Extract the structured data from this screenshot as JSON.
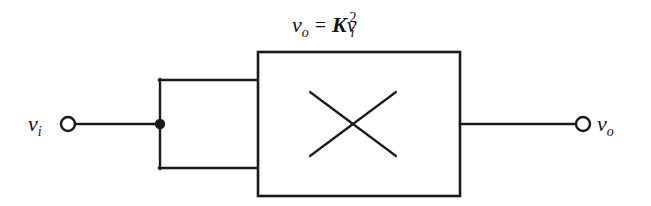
{
  "diagram": {
    "background_color": "#ffffff",
    "stroke_color": "#1a1a1a",
    "equation": {
      "lhs_var": "v",
      "lhs_sub": "o",
      "equals": "=",
      "gain": "K",
      "rhs_var": "v",
      "rhs_sub": "i",
      "rhs_sup": "2",
      "plain_text": "v_o = K v_i^2"
    },
    "input_terminal": {
      "var": "v",
      "sub": "i",
      "plain_text": "v_i"
    },
    "output_terminal": {
      "var": "v",
      "sub": "o",
      "plain_text": "v_o"
    },
    "block": {
      "symbol": "multiplier-x",
      "x": 258,
      "y": 52,
      "width": 202,
      "height": 144
    },
    "junction": {
      "x": 160,
      "y": 124
    },
    "terminals": {
      "input_circle": {
        "cx": 68,
        "cy": 124,
        "r": 7
      },
      "output_circle": {
        "cx": 583,
        "cy": 124,
        "r": 7
      }
    },
    "wires": {
      "input_lead": {
        "x1": 75,
        "y1": 124,
        "x2": 160,
        "y2": 124
      },
      "split_vertical": {
        "x1": 160,
        "y1": 80,
        "x2": 160,
        "y2": 168
      },
      "upper_feedback": {
        "x1": 160,
        "y1": 80,
        "x2": 258,
        "y2": 80
      },
      "lower_feedback": {
        "x1": 160,
        "y1": 168,
        "x2": 258,
        "y2": 168
      },
      "output_lead": {
        "x1": 460,
        "y1": 124,
        "x2": 576,
        "y2": 124
      }
    },
    "cross": {
      "stroke1": {
        "x1": 310,
        "y1": 92,
        "x2": 396,
        "y2": 156
      },
      "stroke2": {
        "x1": 396,
        "y1": 92,
        "x2": 310,
        "y2": 156
      }
    }
  }
}
